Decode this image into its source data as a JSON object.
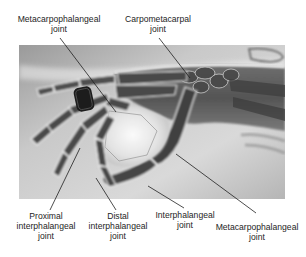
{
  "figure": {
    "image": {
      "type": "x-ray",
      "subject": "hand-and-wrist",
      "colors": {
        "background_light": "#e9e9e9",
        "mid_gray": "#a8a8a8",
        "bone_dark": "#4a4a4a",
        "ring_dark": "#1c1c1c",
        "edge_glow": "#f7f7f7"
      }
    },
    "labels": {
      "top_left": {
        "line1": "Metacarpophalangeal",
        "line2": "joint"
      },
      "top_right": {
        "line1": "Carpometacarpal",
        "line2": "joint"
      },
      "bottom_1": {
        "line1": "Proximal",
        "line2": "interphalangeal",
        "line3": "joint"
      },
      "bottom_2": {
        "line1": "Distal",
        "line2": "interphalangeal",
        "line3": "joint"
      },
      "bottom_3": {
        "line1": "Interphalangeal",
        "line2": "joint"
      },
      "bottom_4": {
        "line1": "Metacarpophalangeal",
        "line2": "joint"
      }
    }
  }
}
